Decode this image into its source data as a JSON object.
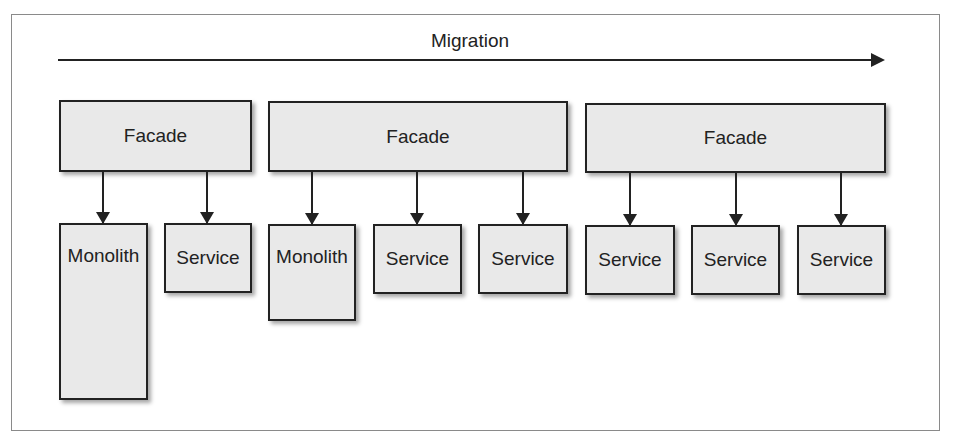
{
  "diagram": {
    "migration_label": "Migration",
    "stages": [
      {
        "facade": "Facade",
        "components": [
          "Monolith",
          "Service"
        ]
      },
      {
        "facade": "Facade",
        "components": [
          "Monolith",
          "Service",
          "Service"
        ]
      },
      {
        "facade": "Facade",
        "components": [
          "Service",
          "Service",
          "Service"
        ]
      }
    ]
  },
  "colors": {
    "box_fill": "#e9e9e9",
    "stroke": "#222222",
    "frame": "#8a8a8a"
  }
}
